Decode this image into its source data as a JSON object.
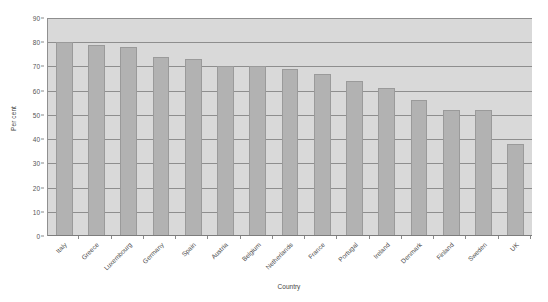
{
  "chart_data": {
    "type": "bar",
    "title": "",
    "subtitle": "",
    "xlabel": "Country",
    "ylabel": "Per cent",
    "categories": [
      "Italy",
      "Greece",
      "Luxembourg",
      "Germany",
      "Spain",
      "Austria",
      "Belgium",
      "Netherlands",
      "France",
      "Portugal",
      "Ireland",
      "Denmark",
      "Finland",
      "Sweden",
      "UK"
    ],
    "values": [
      80,
      79,
      78,
      74,
      73,
      70,
      70,
      69,
      67,
      64,
      61,
      56,
      52,
      52,
      38
    ],
    "ylim": [
      0,
      90
    ],
    "ytick_step": 10,
    "yticks": [
      "90",
      "80",
      "70",
      "60",
      "50",
      "40",
      "30",
      "20",
      "10",
      "0"
    ],
    "grid": true,
    "legend": false,
    "legend_position": "none",
    "colors": {
      "bar_fill": "#b2b2b2",
      "bar_border": "#9a9a9a",
      "plot_background": "#d9d9d9",
      "figure_background": "#ffffff",
      "gridline": "#8e8e8e",
      "axis_line": "#7d7d7d",
      "tick_text": "#555555",
      "axis_title_text": "#444444"
    }
  }
}
